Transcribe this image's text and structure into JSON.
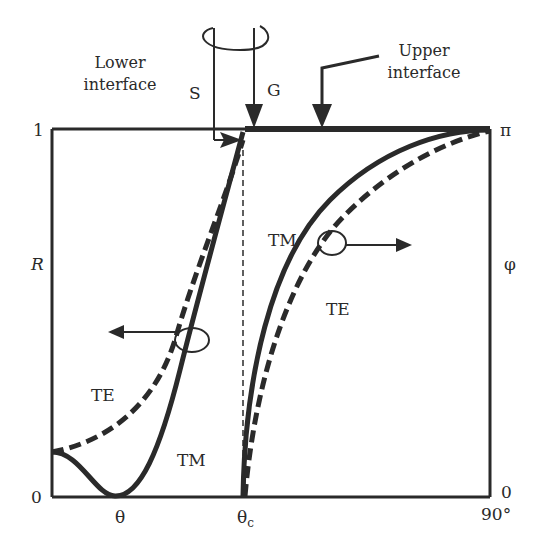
{
  "annotations": {
    "lower_interface_line1": "Lower",
    "lower_interface_line2": "interface",
    "upper_interface_line1": "Upper",
    "upper_interface_line2": "interface",
    "s_label": "S",
    "g_label": "G"
  },
  "axes": {
    "left_label": "R",
    "right_label": "φ",
    "left_top_tick": "1",
    "left_bottom_tick": "0",
    "right_top_tick": "π",
    "right_bottom_tick": "0",
    "x_tick_theta": "θ",
    "x_tick_theta_c_base": "θ",
    "x_tick_theta_c_sub": "c",
    "x_tick_end": "90°"
  },
  "curves": {
    "left_te": "TE",
    "left_tm": "TM",
    "right_tm": "TM",
    "right_te": "TE"
  },
  "colors": {
    "ink": "#2a2a2a",
    "background": "#ffffff"
  }
}
